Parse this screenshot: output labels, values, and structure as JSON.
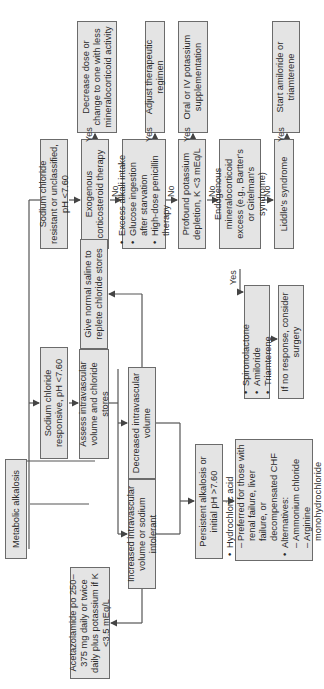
{
  "title": "Metabolic alkalosis",
  "nodes": {
    "root": "Metabolic alkalosis",
    "resistant": "Sodium chloride resistant or unclassified, pH <7.60",
    "responsive": "Sodium chloride responsive, pH <7.60",
    "exogenous": "Exogenous corticosteroid therapy",
    "decrease_dose": "Decrease dose or change to one with less mineralocorticoid activity",
    "causes": [
      "Excess alkali intake",
      "Glucose ingestion after starvation",
      "High-dose penicillin therapy"
    ],
    "adjust": "Adjust therapeutic regimen",
    "potassium_depletion": "Profound potassium depletion, K <3 mEq/L",
    "potassium_supp": "Oral or IV potassium supplementation",
    "endogenous": "Endogenous mineralocorticoid excess (e.g., Bartter's or Gitelman's syndrome)",
    "diuretics": [
      "Spironolactone",
      "Amiloride",
      "Triamterene"
    ],
    "surgery": "If no response, consider surgery",
    "liddle": "Liddle's syndrome",
    "amiloride": "Start amiloride or triamterene",
    "assess": "Assess intravascular volume and chloride stores",
    "decreased_vol": "Decreased intravascular volume",
    "saline": "Give normal saline to replete chloride stores",
    "increased_vol": "Increased intravascular volume or sodium intolerant",
    "acetazolamide": "Acetazolamide po 250–375 mg daily or twice daily plus potassium if K <3.5 mEq/L",
    "persistent": "Persistent alkalosis or initial pH >7.60",
    "acid_therapy": {
      "item1": "Hydrochloric acid",
      "item1_sub": "Preferred for those with renal failure, liver failure, or decompensated CHF",
      "item2": "Alternatives:",
      "item2_subs": [
        "Ammonium chloride",
        "Arginine monohydrochloride"
      ]
    }
  },
  "labels": {
    "yes": "Yes",
    "no": "No"
  },
  "colors": {
    "box_fill": "#e4e4e4",
    "box_border": "#6b6b6b",
    "line": "#555555"
  }
}
